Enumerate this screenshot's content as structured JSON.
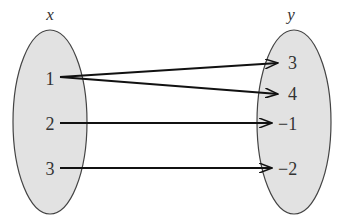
{
  "diagram": {
    "type": "mapping",
    "domain_label": "x",
    "range_label": "y",
    "domain": [
      "1",
      "2",
      "3"
    ],
    "range": [
      "3",
      "4",
      "−1",
      "−2"
    ],
    "mappings": [
      {
        "from": "1",
        "to": "3"
      },
      {
        "from": "1",
        "to": "4"
      },
      {
        "from": "2",
        "to": "−1"
      },
      {
        "from": "3",
        "to": "−2"
      }
    ],
    "colors": {
      "ellipse_fill": "#e2e2e2",
      "ellipse_stroke": "#444444",
      "arrow": "#111111"
    }
  }
}
